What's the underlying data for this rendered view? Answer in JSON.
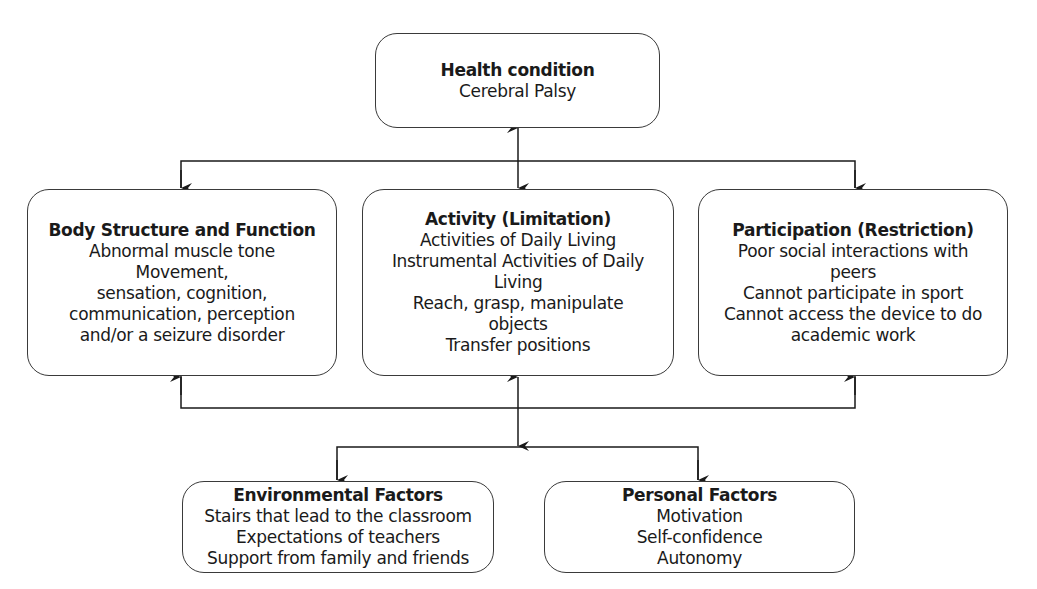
{
  "diagram": {
    "type": "ICF framework",
    "health_condition": {
      "title": "Health condition",
      "lines": [
        "Cerebral Palsy"
      ]
    },
    "body_structure": {
      "title": "Body Structure and Function",
      "lines": [
        "Abnormal muscle tone",
        "Movement,",
        "sensation, cognition,",
        "communication, perception",
        "and/or a seizure disorder"
      ]
    },
    "activity": {
      "title": "Activity (Limitation)",
      "lines": [
        "Activities of Daily Living",
        "Instrumental Activities of Daily",
        "Living",
        "Reach, grasp, manipulate",
        "objects",
        "Transfer positions"
      ]
    },
    "participation": {
      "title": "Participation (Restriction)",
      "lines": [
        "Poor social interactions with",
        "peers",
        "Cannot participate in sport",
        "Cannot access the device to do",
        "academic work"
      ]
    },
    "environmental": {
      "title": "Environmental Factors",
      "lines": [
        "Stairs that lead to the classroom",
        "Expectations of teachers",
        "Support from family and friends"
      ]
    },
    "personal": {
      "title": "Personal Factors",
      "lines": [
        "Motivation",
        "Self-confidence",
        "Autonomy"
      ]
    },
    "connections": [
      {
        "from": "health_condition",
        "to": "activity",
        "type": "bidirectional"
      },
      {
        "from": "health_condition",
        "to": "body_structure",
        "type": "arrow"
      },
      {
        "from": "health_condition",
        "to": "participation",
        "type": "arrow"
      },
      {
        "from": "activity",
        "to": "environmental",
        "type": "arrow"
      },
      {
        "from": "activity",
        "to": "personal",
        "type": "arrow"
      },
      {
        "from": "bottom_bus",
        "to": "body_structure",
        "type": "arrow"
      },
      {
        "from": "bottom_bus",
        "to": "participation",
        "type": "arrow"
      },
      {
        "from": "bottom_bus",
        "to": "activity",
        "type": "bidirectional"
      }
    ],
    "line_color": "#1a1a1a"
  }
}
